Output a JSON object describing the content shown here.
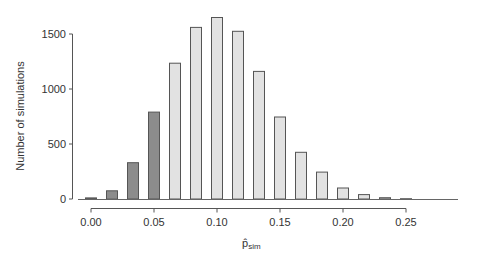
{
  "chart_data": {
    "type": "bar",
    "title": "",
    "xlabel": "p̂_sim",
    "xlabel_main": "p̂",
    "xlabel_sub": "sim",
    "ylabel": "Number of simulations",
    "x": [
      0.0,
      0.0167,
      0.0333,
      0.05,
      0.0667,
      0.0833,
      0.1,
      0.1167,
      0.1333,
      0.15,
      0.1667,
      0.1833,
      0.2,
      0.2167,
      0.2333,
      0.25
    ],
    "values": [
      10,
      75,
      330,
      790,
      1235,
      1560,
      1650,
      1525,
      1160,
      745,
      425,
      245,
      100,
      40,
      12,
      3
    ],
    "highlighted_up_to_x": 0.05,
    "colors": {
      "highlight": "#8c8c8c",
      "normal": "#e2e2e2",
      "outline": "#555555"
    },
    "xticks": [
      "0.00",
      "0.05",
      "0.10",
      "0.15",
      "0.20",
      "0.25"
    ],
    "xtick_values": [
      0.0,
      0.05,
      0.1,
      0.15,
      0.2,
      0.25
    ],
    "yticks": [
      "0",
      "500",
      "1000",
      "1500"
    ],
    "ytick_values": [
      0,
      500,
      1000,
      1500
    ],
    "xlim": [
      -0.012,
      0.29
    ],
    "ylim": [
      0,
      1650
    ],
    "grid": false,
    "legend": null
  }
}
